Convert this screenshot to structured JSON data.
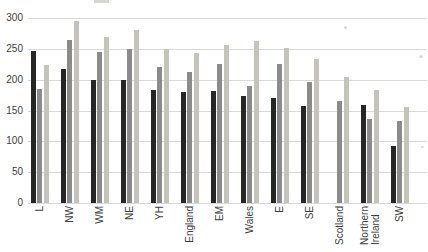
{
  "chart_data": {
    "type": "bar",
    "title": "",
    "xlabel": "",
    "ylabel": "",
    "ylim": [
      0,
      300
    ],
    "yticks": [
      0,
      50,
      100,
      150,
      200,
      250,
      300
    ],
    "grid": true,
    "legend": false,
    "categories": [
      "L",
      "NW",
      "WM",
      "NE",
      "YH",
      "England",
      "EM",
      "Wales",
      "E",
      "SE",
      "Scotland",
      "Northern\nIreland",
      "SW"
    ],
    "series": [
      {
        "name": "dark",
        "color": "#262626",
        "values": [
          247,
          217,
          200,
          199,
          183,
          180,
          181,
          174,
          171,
          158,
          null,
          159,
          93
        ]
      },
      {
        "name": "medium-gray",
        "color": "#8b8b8b",
        "values": [
          185,
          265,
          245,
          250,
          220,
          212,
          226,
          190,
          225,
          197,
          165,
          137,
          133
        ]
      },
      {
        "name": "light-gray",
        "color": "#c4c4ba",
        "values": [
          224,
          295,
          270,
          280,
          249,
          243,
          256,
          262,
          252,
          234,
          205,
          183,
          155
        ]
      }
    ]
  }
}
